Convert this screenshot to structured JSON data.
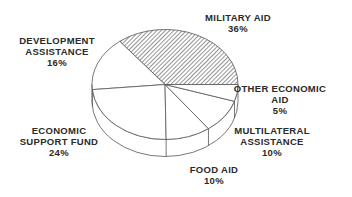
{
  "chart_data": {
    "type": "pie",
    "style": "3d-exploded-none",
    "title": "",
    "unit": "%",
    "slices": [
      {
        "label": "MILITARY AID",
        "value": 36,
        "pattern": "hatched"
      },
      {
        "label": "DEVELOPMENT ASSISTANCE",
        "value": 16,
        "pattern": "none"
      },
      {
        "label": "ECONOMIC SUPPORT FUND",
        "value": 24,
        "pattern": "none"
      },
      {
        "label": "FOOD AID",
        "value": 10,
        "pattern": "none"
      },
      {
        "label": "MULTILATERAL ASSISTANCE",
        "value": 10,
        "pattern": "none"
      },
      {
        "label": "OTHER ECONOMIC AID",
        "value": 5,
        "pattern": "none"
      }
    ],
    "legend": "none (labels placed beside slices)"
  },
  "labels": {
    "military": {
      "line1": "MILITARY AID",
      "pct": "36%"
    },
    "development": {
      "line1": "DEVELOPMENT",
      "line2": "ASSISTANCE",
      "pct": "16%"
    },
    "esf": {
      "line1": "ECONOMIC",
      "line2": "SUPPORT FUND",
      "pct": "24%"
    },
    "food": {
      "line1": "FOOD AID",
      "pct": "10%"
    },
    "multilateral": {
      "line1": "MULTILATERAL",
      "line2": "ASSISTANCE",
      "pct": "10%"
    },
    "other": {
      "line1": "OTHER ECONOMIC",
      "line2": "AID",
      "pct": "5%"
    }
  },
  "colors": {
    "stroke": "#555555",
    "fill": "#ffffff",
    "hatch": "#777777"
  }
}
